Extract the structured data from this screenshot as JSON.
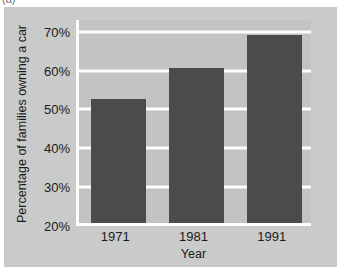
{
  "figure": {
    "label": "(a)",
    "background_color": "#c9caca",
    "plot_background_color": "#c2c3c3"
  },
  "chart_data": {
    "type": "bar",
    "title": "",
    "categories": [
      "1971",
      "1981",
      "1991"
    ],
    "values": [
      52,
      60,
      68.5
    ],
    "series": [
      {
        "name": "Percentage of families owning a car",
        "values": [
          52,
          60,
          68.5
        ]
      }
    ],
    "xlabel": "Year",
    "ylabel": "Percentage of families owning a car",
    "ylim": [
      20,
      73
    ],
    "ytick_values": [
      20,
      30,
      40,
      50,
      60,
      70
    ],
    "ytick_labels": [
      "20%",
      "30%",
      "40%",
      "50%",
      "60%",
      "70%"
    ],
    "gridlines": "horizontal",
    "grid_color": "#fdfdfd",
    "bar_color": "#4b4b4c",
    "legend": "none"
  }
}
